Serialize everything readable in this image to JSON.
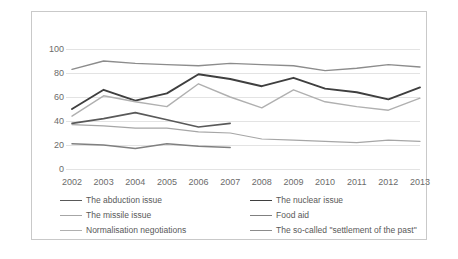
{
  "chart_data": {
    "type": "line",
    "title": "",
    "xlabel": "",
    "ylabel": "",
    "ylim": [
      0,
      100
    ],
    "yticks": [
      0,
      20,
      40,
      60,
      80,
      100
    ],
    "grid": true,
    "legend_position": "bottom",
    "categories": [
      "2002",
      "2003",
      "2004",
      "2005",
      "2006",
      "2007",
      "2008",
      "2009",
      "2010",
      "2011",
      "2012",
      "2013"
    ],
    "series": [
      {
        "name": "The abduction issue",
        "color": "#595959",
        "width": 1.6,
        "values": [
          38,
          42,
          47,
          41,
          35,
          38,
          null,
          null,
          null,
          null,
          null,
          null
        ]
      },
      {
        "name": "The nuclear issue",
        "color": "#3f3f3f",
        "width": 1.9,
        "values": [
          50,
          66,
          57,
          63,
          79,
          75,
          69,
          76,
          67,
          64,
          58,
          68
        ]
      },
      {
        "name": "The missile issue",
        "color": "#a6a6a6",
        "width": 1.2,
        "values": [
          37,
          36,
          34,
          34,
          31,
          30,
          25,
          24,
          23,
          22,
          24,
          23
        ]
      },
      {
        "name": "Food aid",
        "color": "#808080",
        "width": 1.5,
        "values": [
          21,
          20,
          17,
          21,
          19,
          18,
          null,
          null,
          null,
          null,
          null,
          null
        ]
      },
      {
        "name": "Normalisation negotiations",
        "color": "#b0b0b0",
        "width": 1.4,
        "values": [
          44,
          61,
          56,
          52,
          71,
          60,
          51,
          66,
          56,
          52,
          49,
          59
        ]
      },
      {
        "name": "The so-called \"settlement of the past\"",
        "color": "#8c8c8c",
        "width": 1.4,
        "values": [
          83,
          90,
          88,
          87,
          86,
          88,
          87,
          86,
          82,
          84,
          87,
          85
        ]
      }
    ]
  },
  "legend": {
    "items": [
      {
        "label": "The abduction issue"
      },
      {
        "label": "The nuclear issue"
      },
      {
        "label": "The missile issue"
      },
      {
        "label": "Food aid"
      },
      {
        "label": "Normalisation negotiations"
      },
      {
        "label": "The so-called \"settlement of the past\""
      }
    ]
  },
  "watermark": {
    "left": "",
    "right": ""
  }
}
